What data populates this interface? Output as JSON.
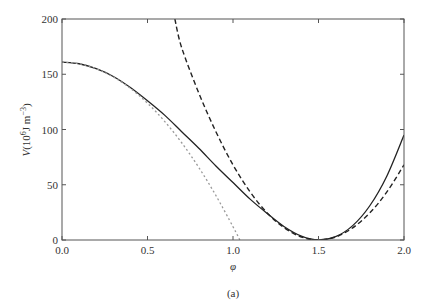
{
  "chart_data": {
    "type": "line",
    "title": "",
    "caption": "(a)",
    "xlabel": "φ",
    "ylabel": "V(10⁶J m⁻³)",
    "ylabel_parts": {
      "var": "V",
      "unit_prefix": "(10",
      "unit_exp": "6",
      "unit_mid": "J m",
      "unit_exp2": "−3",
      "unit_end": ")"
    },
    "xlim": [
      0.0,
      2.0
    ],
    "ylim": [
      0,
      200
    ],
    "xticks": [
      "0.0",
      "0.5",
      "1.0",
      "1.5",
      "2.0"
    ],
    "xtick_values": [
      0.0,
      0.5,
      1.0,
      1.5,
      2.0
    ],
    "yticks": [
      "0",
      "50",
      "100",
      "150",
      "200"
    ],
    "ytick_values": [
      0,
      50,
      100,
      150,
      200
    ],
    "grid": false,
    "legend": null,
    "series": [
      {
        "name": "full potential",
        "style": "solid",
        "color": "#222222",
        "x": [
          0.0,
          0.1,
          0.2,
          0.3,
          0.4,
          0.5,
          0.6,
          0.7,
          0.8,
          0.9,
          1.0,
          1.1,
          1.2,
          1.3,
          1.4,
          1.5,
          1.6,
          1.7,
          1.8,
          1.9,
          2.0
        ],
        "y": [
          161,
          159.5,
          155,
          148,
          138,
          126,
          113,
          98,
          83,
          67,
          52,
          37,
          24,
          12,
          3.5,
          0,
          3,
          13,
          31,
          58,
          95
        ]
      },
      {
        "name": "quadratic approximation about minimum",
        "style": "dashed",
        "color": "#222222",
        "x": [
          0.66,
          0.7,
          0.8,
          0.9,
          1.0,
          1.1,
          1.2,
          1.3,
          1.4,
          1.5,
          1.6,
          1.7,
          1.8,
          1.9,
          2.0
        ],
        "y": [
          200,
          174,
          133,
          98,
          68,
          43.5,
          24.5,
          11,
          2.7,
          0,
          2.7,
          11,
          24.5,
          43.5,
          68
        ]
      },
      {
        "name": "quadratic approximation about φ = 0",
        "style": "dotted",
        "color": "#999999",
        "x": [
          0.0,
          0.1,
          0.2,
          0.3,
          0.4,
          0.5,
          0.6,
          0.7,
          0.8,
          0.9,
          1.0,
          1.04
        ],
        "y": [
          161,
          159.5,
          155,
          147.6,
          137.2,
          123.8,
          107.4,
          88,
          65.6,
          40.3,
          12,
          0
        ]
      }
    ]
  }
}
